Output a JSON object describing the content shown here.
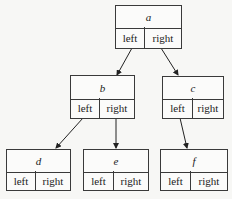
{
  "diagram": {
    "type": "binary-tree",
    "field_labels": {
      "left": "left",
      "right": "right"
    },
    "nodes": [
      {
        "id": "a",
        "label": "a"
      },
      {
        "id": "b",
        "label": "b"
      },
      {
        "id": "c",
        "label": "c"
      },
      {
        "id": "d",
        "label": "d"
      },
      {
        "id": "e",
        "label": "e"
      },
      {
        "id": "f",
        "label": "f"
      }
    ],
    "edges": [
      {
        "from": "a",
        "field": "left",
        "to": "b"
      },
      {
        "from": "a",
        "field": "right",
        "to": "c"
      },
      {
        "from": "b",
        "field": "left",
        "to": "d"
      },
      {
        "from": "b",
        "field": "right",
        "to": "e"
      },
      {
        "from": "c",
        "field": "left",
        "to": "f"
      }
    ]
  }
}
